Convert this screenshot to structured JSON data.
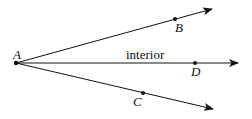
{
  "diagram": {
    "points": {
      "A": {
        "label": "A",
        "x": 16,
        "y": 63
      },
      "B": {
        "label": "B",
        "x": 175,
        "y": 19
      },
      "C": {
        "label": "C",
        "x": 143,
        "y": 93
      },
      "D": {
        "label": "D",
        "x": 195,
        "y": 63
      }
    },
    "rays": [
      {
        "from": "A",
        "through": "B",
        "end": [
          212,
          9
        ]
      },
      {
        "from": "A",
        "through": "D",
        "end": [
          238,
          63
        ]
      },
      {
        "from": "A",
        "through": "C",
        "end": [
          213,
          109
        ]
      }
    ],
    "annotation": "interior",
    "colors": {
      "stroke": "#111111",
      "background": "#ffffff"
    }
  }
}
